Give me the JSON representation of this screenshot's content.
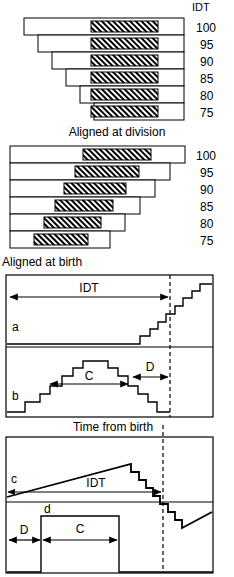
{
  "figure": {
    "panels": [
      {
        "id": "panel-aligned-at-division",
        "caption": "Aligned at division",
        "column_header": "IDT",
        "alignment": "right",
        "rows": [
          {
            "idt": "100",
            "bar_start": 0,
            "bar_end": 100,
            "hatch_start": 42,
            "hatch_end": 84
          },
          {
            "idt": "95",
            "bar_start": 9,
            "bar_end": 100,
            "hatch_start": 42,
            "hatch_end": 84
          },
          {
            "idt": "90",
            "bar_start": 18,
            "bar_end": 100,
            "hatch_start": 42,
            "hatch_end": 84
          },
          {
            "idt": "85",
            "bar_start": 27,
            "bar_end": 100,
            "hatch_start": 42,
            "hatch_end": 84
          },
          {
            "idt": "80",
            "bar_start": 36,
            "bar_end": 100,
            "hatch_start": 42,
            "hatch_end": 84
          },
          {
            "idt": "75",
            "bar_start": 45,
            "bar_end": 100,
            "hatch_start": 42,
            "hatch_end": 84
          }
        ]
      },
      {
        "id": "panel-aligned-at-birth",
        "caption": "Aligned at birth",
        "column_header": "",
        "alignment": "left",
        "rows": [
          {
            "idt": "100",
            "bar_start": 0,
            "bar_end": 100,
            "hatch_start": 42,
            "hatch_end": 84
          },
          {
            "idt": "95",
            "bar_start": 0,
            "bar_end": 91,
            "hatch_start": 37,
            "hatch_end": 77
          },
          {
            "idt": "90",
            "bar_start": 0,
            "bar_end": 82,
            "hatch_start": 32,
            "hatch_end": 70
          },
          {
            "idt": "85",
            "bar_start": 0,
            "bar_end": 73,
            "hatch_start": 27,
            "hatch_end": 63
          },
          {
            "idt": "80",
            "bar_start": 0,
            "bar_end": 64,
            "hatch_start": 21,
            "hatch_end": 56
          },
          {
            "idt": "75",
            "bar_start": 0,
            "bar_end": 55,
            "hatch_start": 16,
            "hatch_end": 49
          }
        ]
      },
      {
        "id": "panel-traces-ab",
        "caption": "Time from birth",
        "curves": [
          {
            "label": "a",
            "description": "flat then ascending staircase"
          },
          {
            "label": "b",
            "description": "ascending staircase to plateau then descending staircase"
          }
        ],
        "annotations": [
          {
            "label": "IDT",
            "type": "double-arrow"
          },
          {
            "label": "C",
            "type": "double-arrow"
          },
          {
            "label": "D",
            "type": "double-arrow"
          }
        ]
      },
      {
        "id": "panel-traces-cd",
        "curves": [
          {
            "label": "c",
            "description": "linear ramp then descending staircase, restarts"
          },
          {
            "label": "d",
            "description": "rectangular pulse"
          }
        ],
        "annotations": [
          {
            "label": "IDT",
            "type": "single-arrow"
          },
          {
            "label": "D",
            "type": "double-arrow"
          },
          {
            "label": "C",
            "type": "double-arrow"
          }
        ]
      }
    ]
  }
}
